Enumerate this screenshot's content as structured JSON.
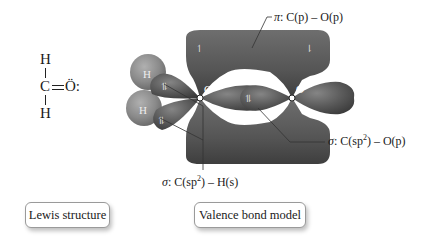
{
  "lewis_structure": {
    "atoms": {
      "top_h": "H",
      "carbon": "C",
      "bond": "═",
      "oxygen": "Ö:",
      "bottom_h": "H"
    },
    "caption": "Lewis structure"
  },
  "valence_bond_model": {
    "caption": "Valence bond model",
    "atom_labels": {
      "h1": "H",
      "h2": "H",
      "carbon": "C",
      "oxygen": "O"
    },
    "electron_markers": {
      "pi_top_left": "↿",
      "pi_top_right": "⇂",
      "ch_top": "⥮",
      "ch_bottom": "⥮",
      "co_sigma": "⥮"
    },
    "bond_labels": {
      "pi": {
        "symbol": "π",
        "text": ": C(p) – O(p)"
      },
      "sigma_co": {
        "symbol": "σ",
        "text_a": ": C(sp",
        "sup": "2",
        "text_b": ") – O(p)"
      },
      "sigma_ch": {
        "symbol": "σ",
        "text_a": ": C(sp",
        "sup": "2",
        "text_b": ") – H(s)"
      }
    }
  },
  "colors": {
    "orbital_fill": "#5a5a5a",
    "orbital_dark": "#3a3a3a",
    "orbital_highlight": "#8a8a8a",
    "hydrogen_fill": "#8c8c8c",
    "leader_line": "#333333",
    "caption_border": "#9a9a9a"
  }
}
